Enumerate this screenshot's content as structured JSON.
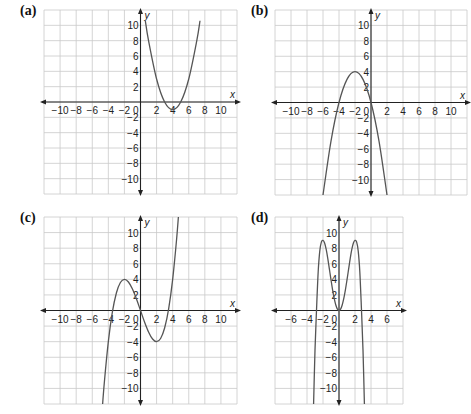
{
  "chart_data": [
    {
      "id": "a",
      "label": "(a)",
      "type": "line",
      "title": "(a)",
      "xlabel": "x",
      "ylabel": "y",
      "xlim": [
        -12,
        12
      ],
      "ylim": [
        -12,
        12
      ],
      "grid": true,
      "x_ticks": [
        -10,
        -8,
        -6,
        -4,
        -2,
        2,
        4,
        6,
        8,
        10
      ],
      "y_ticks": [
        10,
        8,
        6,
        4,
        2,
        -2,
        -4,
        -6,
        -8,
        -10
      ],
      "origin_label": "0",
      "description": "Upward parabola, vertex (4, -1), x-intercepts 3 and 5",
      "series": [
        {
          "name": "y = (x-4)^2 - 1",
          "points": [
            [
              0.6,
              10.6
            ],
            [
              1,
              8
            ],
            [
              2,
              3
            ],
            [
              3,
              0
            ],
            [
              4,
              -1
            ],
            [
              5,
              0
            ],
            [
              6,
              3
            ],
            [
              7,
              8
            ],
            [
              7.4,
              10.6
            ]
          ]
        }
      ],
      "box": {
        "left": 44,
        "top": 10,
        "width": 193,
        "height": 184
      },
      "label_pos": {
        "left": 20,
        "top": 3
      }
    },
    {
      "id": "b",
      "label": "(b)",
      "type": "line",
      "title": "(b)",
      "xlabel": "x",
      "ylabel": "y",
      "xlim": [
        -12,
        12
      ],
      "ylim": [
        -12,
        12
      ],
      "grid": true,
      "x_ticks": [
        -10,
        -8,
        -6,
        -4,
        -2,
        2,
        4,
        6,
        8,
        10
      ],
      "y_ticks": [
        10,
        8,
        6,
        4,
        2,
        -2,
        -4,
        -6,
        -8,
        -10
      ],
      "origin_label": "0",
      "description": "Downward parabola, vertex (-2, 4), x-intercepts -4 and 0",
      "series": [
        {
          "name": "y = -(x+2)^2 + 4",
          "points": [
            [
              -6,
              -12
            ],
            [
              -5,
              -5
            ],
            [
              -4,
              0
            ],
            [
              -3,
              3
            ],
            [
              -2,
              4
            ],
            [
              -1,
              3
            ],
            [
              0,
              0
            ],
            [
              1,
              -5
            ],
            [
              2,
              -12
            ]
          ]
        }
      ],
      "box": {
        "left": 275,
        "top": 10,
        "width": 192,
        "height": 185
      },
      "label_pos": {
        "left": 251,
        "top": 3
      }
    },
    {
      "id": "c",
      "label": "(c)",
      "type": "line",
      "title": "(c)",
      "xlabel": "x",
      "ylabel": "y",
      "xlim": [
        -12,
        12
      ],
      "ylim": [
        -12,
        12
      ],
      "grid": true,
      "x_ticks": [
        -10,
        -8,
        -6,
        -4,
        -2,
        2,
        4,
        6,
        8,
        10
      ],
      "y_ticks": [
        10,
        8,
        6,
        4,
        2,
        -2,
        -4,
        -6,
        -8,
        -10
      ],
      "origin_label": "0",
      "description": "Cubic, local max (-2, 4), local min (2, -4), x-intercepts about -3.5, 0, 3.5",
      "series": [
        {
          "name": "y = x^3/4 - 3x",
          "points": [
            [
              -4.8,
              -13.25
            ],
            [
              -4.5,
              -9.28
            ],
            [
              -4,
              -4
            ],
            [
              -3.5,
              -0.22
            ],
            [
              -3,
              2.25
            ],
            [
              -2.5,
              3.59
            ],
            [
              -2,
              4
            ],
            [
              -1.5,
              3.66
            ],
            [
              -1,
              2.75
            ],
            [
              -0.5,
              1.47
            ],
            [
              0,
              0
            ],
            [
              0.5,
              -1.47
            ],
            [
              1,
              -2.75
            ],
            [
              1.5,
              -3.66
            ],
            [
              2,
              -4
            ],
            [
              2.5,
              -3.59
            ],
            [
              3,
              -2.25
            ],
            [
              3.5,
              0.22
            ],
            [
              4,
              4
            ],
            [
              4.5,
              9.28
            ],
            [
              4.8,
              13.25
            ]
          ]
        }
      ],
      "box": {
        "left": 44,
        "top": 217,
        "width": 193,
        "height": 187
      },
      "label_pos": {
        "left": 20,
        "top": 210
      }
    },
    {
      "id": "d",
      "label": "(d)",
      "type": "line",
      "title": "(d)",
      "xlabel": "x",
      "ylabel": "y",
      "xlim": [
        -8,
        8
      ],
      "ylim": [
        -12,
        12
      ],
      "grid": true,
      "x_ticks": [
        -6,
        -4,
        -2,
        2,
        4,
        6
      ],
      "y_ticks": [
        10,
        8,
        6,
        4,
        2,
        -2,
        -4,
        -6,
        -8,
        -10
      ],
      "origin_label": "0",
      "description": "Quartic (M shape), local maxima (-2, 9) and (2, 9), local min (0, 0), x-intercepts about -2.8, 0, 2.8",
      "series": [
        {
          "name": "y = -(9/16)x^4 + (9/2)x^2",
          "points": [
            [
              -3.2,
              -13.0
            ],
            [
              -3,
              -5.06
            ],
            [
              -2.8,
              0.33
            ],
            [
              -2.6,
              5.0
            ],
            [
              -2.4,
              7.65
            ],
            [
              -2.2,
              8.8
            ],
            [
              -2,
              9
            ],
            [
              -1.8,
              8.67
            ],
            [
              -1.6,
              7.83
            ],
            [
              -1.4,
              6.66
            ],
            [
              -1.2,
              5.3
            ],
            [
              -1,
              3.94
            ],
            [
              -0.8,
              2.65
            ],
            [
              -0.6,
              1.55
            ],
            [
              -0.4,
              0.71
            ],
            [
              -0.2,
              0.18
            ],
            [
              0,
              0
            ],
            [
              0.2,
              0.18
            ],
            [
              0.4,
              0.71
            ],
            [
              0.6,
              1.55
            ],
            [
              0.8,
              2.65
            ],
            [
              1,
              3.94
            ],
            [
              1.2,
              5.3
            ],
            [
              1.4,
              6.66
            ],
            [
              1.6,
              7.83
            ],
            [
              1.8,
              8.67
            ],
            [
              2,
              9
            ],
            [
              2.2,
              8.8
            ],
            [
              2.4,
              7.65
            ],
            [
              2.6,
              5.0
            ],
            [
              2.8,
              0.33
            ],
            [
              3,
              -5.06
            ],
            [
              3.2,
              -13.0
            ]
          ]
        }
      ],
      "box": {
        "left": 275,
        "top": 217,
        "width": 128,
        "height": 187
      },
      "label_pos": {
        "left": 251,
        "top": 210
      }
    }
  ]
}
